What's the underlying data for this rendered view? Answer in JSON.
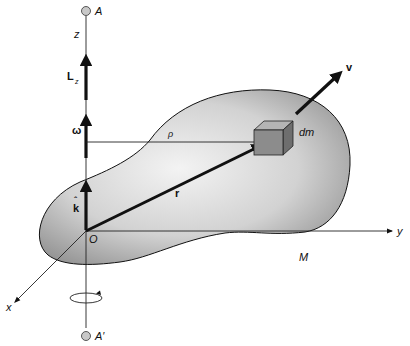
{
  "figure": {
    "labels": {
      "top_point": "A",
      "bottom_point": "A′",
      "z_axis": "z",
      "y_axis": "y",
      "x_axis": "x",
      "origin": "O",
      "angular_momentum": "L",
      "angular_momentum_sub": "z",
      "angular_velocity": "ω",
      "unit_vector": "k",
      "unit_vector_hat": "ˆ",
      "position_vector": "r",
      "perpendicular_distance": "ρ",
      "mass_element": "dm",
      "velocity": "v",
      "body_mass": "M"
    },
    "colors": {
      "ink": "#111111",
      "body_fill_light": "#ececec",
      "body_fill_dark": "#8a8a8a",
      "cube_front": "#8c8c8c",
      "cube_top": "#b4b4b4",
      "cube_side": "#6e6e6e",
      "pivot_fill": "#c8c8c8"
    },
    "rotation_indicator": "counterclockwise"
  }
}
